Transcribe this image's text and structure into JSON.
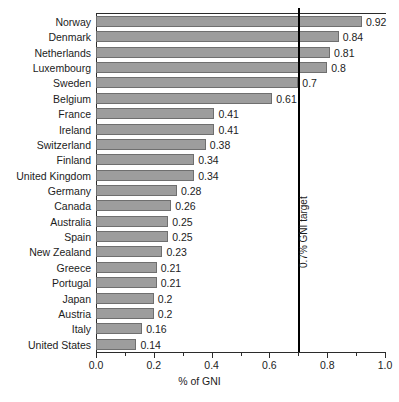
{
  "chart_data": {
    "type": "bar",
    "orientation": "horizontal",
    "title": "",
    "xlabel": "% of GNI",
    "ylabel": "",
    "xlim": [
      0.0,
      1.0
    ],
    "grid": false,
    "legend": "none",
    "categories": [
      "Norway",
      "Denmark",
      "Netherlands",
      "Luxembourg",
      "Sweden",
      "Belgium",
      "France",
      "Ireland",
      "Switzerland",
      "Finland",
      "United Kingdom",
      "Germany",
      "Canada",
      "Australia",
      "Spain",
      "New Zealand",
      "Greece",
      "Portugal",
      "Japan",
      "Austria",
      "Italy",
      "United States"
    ],
    "values": [
      0.92,
      0.84,
      0.81,
      0.8,
      0.7,
      0.61,
      0.41,
      0.41,
      0.38,
      0.34,
      0.34,
      0.28,
      0.26,
      0.25,
      0.25,
      0.23,
      0.21,
      0.21,
      0.2,
      0.2,
      0.16,
      0.14
    ],
    "value_labels": [
      "0.92",
      "0.84",
      "0.81",
      "0.8",
      "0.7",
      "0.61",
      "0.41",
      "0.41",
      "0.38",
      "0.34",
      "0.34",
      "0.28",
      "0.26",
      "0.25",
      "0.25",
      "0.23",
      "0.21",
      "0.21",
      "0.2",
      "0.2",
      "0.16",
      "0.14"
    ],
    "xticks_major": [
      0.0,
      0.2,
      0.4,
      0.6,
      0.8,
      1.0
    ],
    "xtick_labels": [
      "0.0",
      "0.2",
      "0.4",
      "0.6",
      "0.8",
      "1.0"
    ],
    "xticks_minor": [
      0.1,
      0.3,
      0.5,
      0.7,
      0.9
    ],
    "annotations": [
      {
        "name": "gni-target-line",
        "value": 0.7,
        "label": "0.7% GNI target",
        "color": "#000000"
      }
    ],
    "colors": {
      "bar_fill": "#9d9d9d",
      "bar_stroke": "#6f6f6f",
      "axis": "#2b2b2b",
      "text": "#1c1c1c",
      "target": "#000000",
      "background": "#ffffff"
    }
  }
}
